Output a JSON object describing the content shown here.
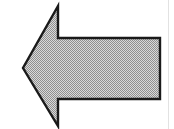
{
  "figure": {
    "alt_text": "Left Arrow",
    "background_color": "#ffffff",
    "canvas": {
      "width": 174,
      "height": 129
    }
  },
  "shape": {
    "name": "left-arrow",
    "kind": "polygon",
    "direction": "left",
    "fill_style": "dither-halftone",
    "fill_color": "#b4b4b4",
    "fill_light_color": "#d9d9d9",
    "fill_dark_color": "#8f8f8f",
    "stroke_color": "#1a1a1a",
    "stroke_width": 2.4,
    "points": "58,6 58,38 160,38 160,99 58,99 58,126 23,68",
    "vertices": [
      {
        "name": "head-top-vertex",
        "x": 58,
        "y": 6
      },
      {
        "name": "shoulder-top-inner",
        "x": 58,
        "y": 38
      },
      {
        "name": "tail-top-right",
        "x": 160,
        "y": 38
      },
      {
        "name": "tail-bottom-right",
        "x": 160,
        "y": 99
      },
      {
        "name": "shoulder-bottom-inner",
        "x": 58,
        "y": 99
      },
      {
        "name": "head-bottom-vertex",
        "x": 58,
        "y": 126
      },
      {
        "name": "arrow-tip",
        "x": 23,
        "y": 68
      }
    ]
  },
  "artifacts": {
    "page_edge_line": {
      "visible": true,
      "x": 168,
      "color": "#e2e2e2"
    }
  }
}
